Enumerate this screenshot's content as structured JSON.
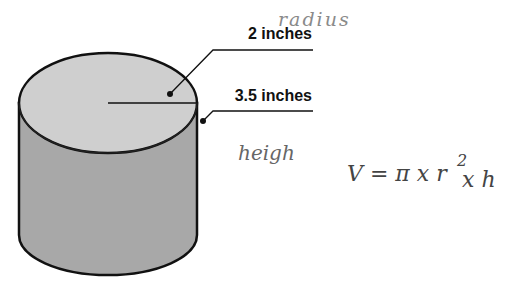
{
  "figure": {
    "type": "cylinder-diagram",
    "colors": {
      "top_face": "#cfcfcf",
      "side_face": "#a8a8a8",
      "outline": "#111111",
      "handwriting": "#555555"
    }
  },
  "labels": {
    "radius_value": "2 inches",
    "height_value": "3.5 inches"
  },
  "annotations": {
    "radius_word": "radius",
    "height_word": "heigh",
    "formula_lhs": "V = π x r",
    "formula_exp": "2",
    "formula_rhs": "x h"
  }
}
